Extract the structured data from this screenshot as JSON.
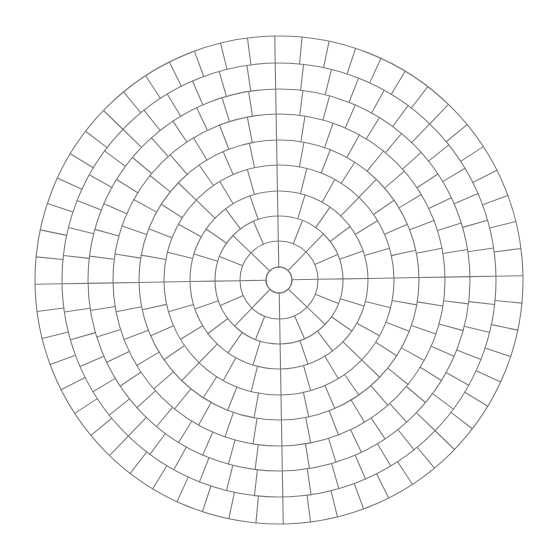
{
  "diagram": {
    "type": "circular-paver-grid",
    "canvas": {
      "width": 549,
      "height": 558,
      "background": "#ffffff"
    },
    "center": {
      "x": 279,
      "y": 280
    },
    "rotation_deg": -1,
    "stroke_color": "#7a7a7a",
    "stroke_width": 1.1,
    "center_circle_radius": 13,
    "ring_radii": [
      13,
      39,
      64,
      89,
      115,
      140,
      166,
      191,
      217,
      244
    ],
    "ring_segments": [
      8,
      16,
      20,
      24,
      32,
      36,
      44,
      48,
      56
    ]
  }
}
